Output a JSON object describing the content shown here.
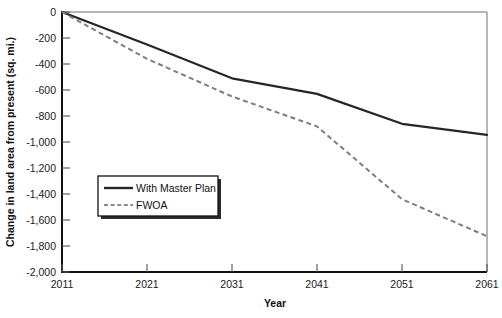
{
  "chart_data": {
    "type": "line",
    "title": "",
    "xlabel": "Year",
    "ylabel": "Change in land area from present (sq. mi.)",
    "x": [
      2011,
      2021,
      2031,
      2041,
      2051,
      2061
    ],
    "xlim": [
      2011,
      2061
    ],
    "ylim": [
      -2000,
      0
    ],
    "grid": false,
    "legend_position": "center-left",
    "xticks": [
      "2011",
      "2021",
      "2031",
      "2041",
      "2051",
      "2061"
    ],
    "yticks": [
      "0",
      "-200",
      "-400",
      "-600",
      "-800",
      "-1,000",
      "-1,200",
      "-1,400",
      "-1,600",
      "-1,800",
      "-2,000"
    ],
    "series": [
      {
        "name": "With Master Plan",
        "style": "solid",
        "color": "#262626",
        "values": [
          0,
          -250,
          -510,
          -630,
          -860,
          -945
        ]
      },
      {
        "name": "FWOA",
        "style": "dashed",
        "color": "#7d7d7d",
        "values": [
          0,
          -360,
          -650,
          -880,
          -1440,
          -1725
        ]
      }
    ]
  },
  "axes": {
    "y_title": "Change in land area from present (sq. mi.)",
    "x_title": "Year",
    "y_tick_labels": [
      "0",
      "-200",
      "-400",
      "-600",
      "-800",
      "-1,000",
      "-1,200",
      "-1,400",
      "-1,600",
      "-1,800",
      "-2,000"
    ],
    "x_tick_labels": [
      "2011",
      "2021",
      "2031",
      "2041",
      "2051",
      "2061"
    ]
  },
  "legend": {
    "items": [
      {
        "label": "With Master Plan",
        "style": "solid"
      },
      {
        "label": "FWOA",
        "style": "dashed"
      }
    ]
  }
}
